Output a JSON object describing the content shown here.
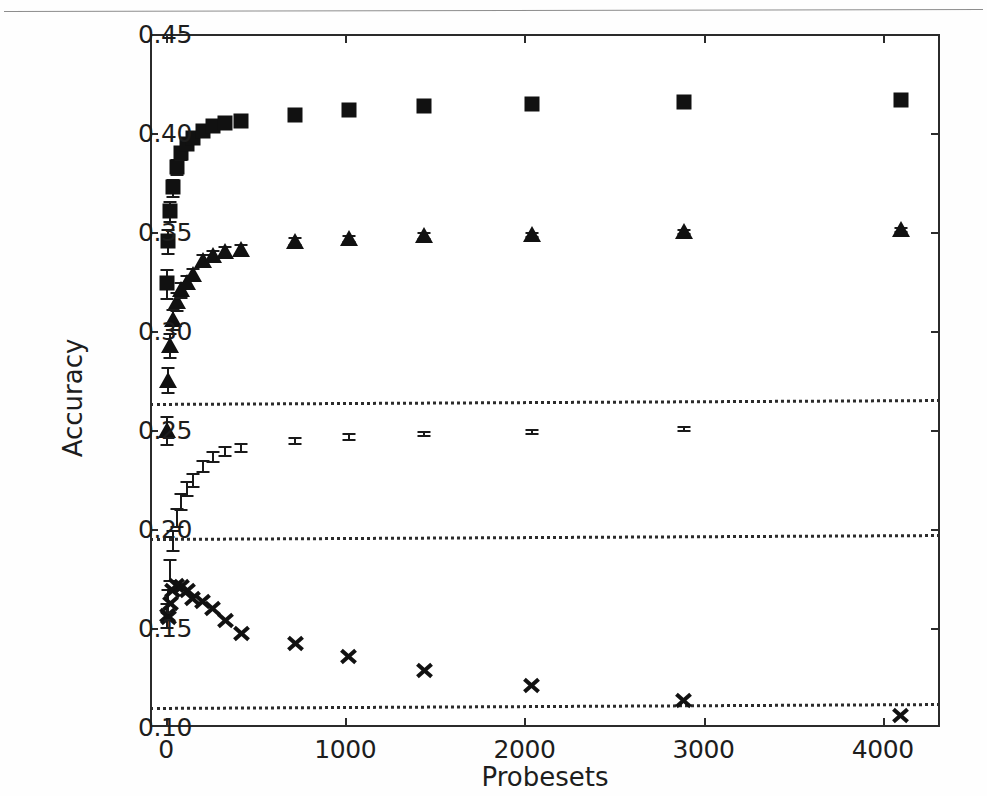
{
  "figure": {
    "top_rule": true
  },
  "chart_data": {
    "type": "scatter",
    "title": "",
    "xlabel": "Probesets",
    "ylabel": "Accuracy",
    "xlim": [
      -90,
      4320
    ],
    "ylim": [
      0.1,
      0.45
    ],
    "grid": false,
    "legend": "none",
    "errorbars": true,
    "xticks": [
      0,
      1000,
      2000,
      3000,
      4000
    ],
    "xticklabels": [
      "0",
      "1000",
      "2000",
      "3000",
      "4000"
    ],
    "yticks": [
      0.1,
      0.15,
      0.2,
      0.25,
      0.3,
      0.35,
      0.4,
      0.45
    ],
    "yticklabels": [
      "0.10",
      "0.15",
      "0.20",
      "0.25",
      "0.30",
      "0.35",
      "0.40",
      "0.45"
    ],
    "reference_lines": [
      {
        "name": "upper-baseline",
        "y_left": 0.2635,
        "y_right": 0.2655,
        "style": "dotted"
      },
      {
        "name": "middle-baseline",
        "y_left": 0.1955,
        "y_right": 0.1975,
        "style": "dotted"
      },
      {
        "name": "lower-baseline",
        "y_left": 0.11,
        "y_right": 0.112,
        "style": "dotted"
      }
    ],
    "series": [
      {
        "name": "series-squares",
        "marker": "square",
        "color": "#111111",
        "points": [
          {
            "x": 5,
            "y": 0.324,
            "yerr": 0.0075
          },
          {
            "x": 12,
            "y": 0.3455,
            "yerr": 0.006
          },
          {
            "x": 22,
            "y": 0.3605,
            "yerr": 0.005
          },
          {
            "x": 38,
            "y": 0.3725,
            "yerr": 0.0042
          },
          {
            "x": 58,
            "y": 0.383,
            "yerr": 0.0038
          },
          {
            "x": 85,
            "y": 0.39,
            "yerr": 0.0032
          },
          {
            "x": 118,
            "y": 0.3945,
            "yerr": 0.0028
          },
          {
            "x": 150,
            "y": 0.3975,
            "yerr": 0.0024
          },
          {
            "x": 205,
            "y": 0.401,
            "yerr": 0.0022
          },
          {
            "x": 260,
            "y": 0.4035,
            "yerr": 0.002
          },
          {
            "x": 330,
            "y": 0.405,
            "yerr": 0.0018
          },
          {
            "x": 420,
            "y": 0.406,
            "yerr": 0.0016
          },
          {
            "x": 720,
            "y": 0.409,
            "yerr": 0.0014
          },
          {
            "x": 1020,
            "y": 0.4115,
            "yerr": 0.0012
          },
          {
            "x": 1440,
            "y": 0.4135,
            "yerr": 0.0011
          },
          {
            "x": 2040,
            "y": 0.4145,
            "yerr": 0.001
          },
          {
            "x": 2890,
            "y": 0.4155,
            "yerr": 0.0009
          },
          {
            "x": 4100,
            "y": 0.4165,
            "yerr": 0.0008
          }
        ]
      },
      {
        "name": "series-triangles",
        "marker": "triangle",
        "color": "#111111",
        "points": [
          {
            "x": 5,
            "y": 0.25,
            "yerr": 0.007
          },
          {
            "x": 12,
            "y": 0.2755,
            "yerr": 0.0065
          },
          {
            "x": 22,
            "y": 0.293,
            "yerr": 0.006
          },
          {
            "x": 38,
            "y": 0.306,
            "yerr": 0.0052
          },
          {
            "x": 58,
            "y": 0.315,
            "yerr": 0.0045
          },
          {
            "x": 85,
            "y": 0.321,
            "yerr": 0.004
          },
          {
            "x": 118,
            "y": 0.325,
            "yerr": 0.0035
          },
          {
            "x": 150,
            "y": 0.329,
            "yerr": 0.003
          },
          {
            "x": 205,
            "y": 0.336,
            "yerr": 0.0028
          },
          {
            "x": 260,
            "y": 0.3385,
            "yerr": 0.0026
          },
          {
            "x": 330,
            "y": 0.3405,
            "yerr": 0.0024
          },
          {
            "x": 420,
            "y": 0.3415,
            "yerr": 0.0022
          },
          {
            "x": 720,
            "y": 0.3455,
            "yerr": 0.0018
          },
          {
            "x": 1020,
            "y": 0.347,
            "yerr": 0.0015
          },
          {
            "x": 1440,
            "y": 0.3485,
            "yerr": 0.0013
          },
          {
            "x": 2040,
            "y": 0.349,
            "yerr": 0.0012
          },
          {
            "x": 2890,
            "y": 0.3505,
            "yerr": 0.0011
          },
          {
            "x": 4100,
            "y": 0.3515,
            "yerr": 0.001
          }
        ]
      },
      {
        "name": "series-crosses",
        "marker": "x",
        "color": "#111111",
        "points": [
          {
            "x": 5,
            "y": 0.1565,
            "yerr": 0.006
          },
          {
            "x": 12,
            "y": 0.164,
            "yerr": 0.0058
          },
          {
            "x": 22,
            "y": 0.1795,
            "yerr": 0.0055
          },
          {
            "x": 38,
            "y": 0.1945,
            "yerr": 0.005
          },
          {
            "x": 58,
            "y": 0.206,
            "yerr": 0.0045
          },
          {
            "x": 85,
            "y": 0.214,
            "yerr": 0.004
          },
          {
            "x": 118,
            "y": 0.2205,
            "yerr": 0.0035
          },
          {
            "x": 150,
            "y": 0.225,
            "yerr": 0.0032
          },
          {
            "x": 205,
            "y": 0.232,
            "yerr": 0.0028
          },
          {
            "x": 260,
            "y": 0.237,
            "yerr": 0.0025
          },
          {
            "x": 330,
            "y": 0.2395,
            "yerr": 0.0022
          },
          {
            "x": 420,
            "y": 0.2415,
            "yerr": 0.002
          },
          {
            "x": 720,
            "y": 0.245,
            "yerr": 0.0016
          },
          {
            "x": 1020,
            "y": 0.247,
            "yerr": 0.0014
          },
          {
            "x": 1440,
            "y": 0.2485,
            "yerr": 0.0012
          },
          {
            "x": 2040,
            "y": 0.2495,
            "yerr": 0.0011
          },
          {
            "x": 2890,
            "y": 0.251,
            "yerr": 0.001
          },
          {
            "x": 4100,
            "y": 0.252,
            "yerr": 0.0009
          }
        ]
      }
    ]
  }
}
